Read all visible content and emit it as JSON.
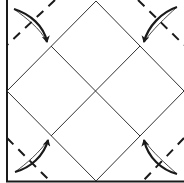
{
  "diagram": {
    "title": "Origami fold step: fold four corners to the center",
    "type": "origami-folding-diagram",
    "colors": {
      "background": "#ffffff",
      "line": "#1a1a1a",
      "crease": "#333333"
    },
    "paper": {
      "shape": "square",
      "edges_drawn": [
        "left",
        "bottom"
      ]
    },
    "creases": {
      "inner_square": "diamond through edge midpoints",
      "center_cross": "two diagonals meeting at center"
    },
    "valley_folds": [
      {
        "corner": "top-left",
        "style": "dashed"
      },
      {
        "corner": "top-right",
        "style": "dashed"
      },
      {
        "corner": "bottom-left",
        "style": "dashed"
      },
      {
        "corner": "bottom-right",
        "style": "dashed"
      }
    ],
    "fold_arrows": [
      {
        "from": "top-left corner",
        "to": "upper-left crease intersection"
      },
      {
        "from": "top-right corner",
        "to": "upper-right crease intersection"
      },
      {
        "from": "bottom-left corner",
        "to": "lower-left crease intersection"
      },
      {
        "from": "bottom-right corner",
        "to": "lower-right crease intersection"
      }
    ]
  }
}
